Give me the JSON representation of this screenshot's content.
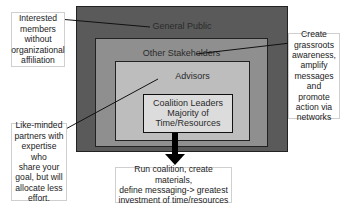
{
  "diagram": {
    "colors": {
      "general_public": "#5a5a5a",
      "other_stakeholders": "#8f8f8f",
      "advisors": "#bdbdbd",
      "coalition_leaders": "#dcdcdc",
      "arrow": "#000000"
    },
    "layers": [
      {
        "id": "general-public",
        "label": "General Public"
      },
      {
        "id": "other-stakeholders",
        "label": "Other Stakeholders"
      },
      {
        "id": "advisors",
        "label": "Advisors"
      },
      {
        "id": "coalition-leaders",
        "label_line1": "Coalition Leaders",
        "label_line2": "Majority of",
        "label_line3": "Time/Resources"
      }
    ],
    "callouts": {
      "general_public": [
        "Interested",
        "members",
        "without",
        "organizational",
        "affiliation"
      ],
      "other_stakeholders": [
        "Create",
        "grassroots",
        "awareness,",
        "amplify",
        "messages",
        "and promote",
        "action via",
        "networks"
      ],
      "advisors": [
        "Like-minded",
        "partners with",
        "expertise who",
        "share your",
        "goal, but will",
        "allocate less",
        "effort."
      ],
      "coalition_leaders": [
        "Run coalition, create materials,",
        "define messaging-> greatest",
        "investment of time/resources"
      ]
    }
  }
}
